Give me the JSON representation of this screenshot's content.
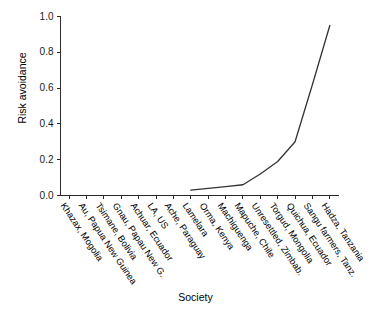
{
  "chart_data": {
    "type": "line",
    "title": "",
    "xlabel": "Society",
    "ylabel": "Risk avoidance",
    "categories": [
      "Khazax, Mogolia",
      "Au, Papua New Guinea",
      "Tsimane, Bolivia",
      "Gnau, Papau New G.",
      "Achuar, Ecuador",
      "LA, US",
      "Ache, Paraguay",
      "Lamelara",
      "Orma, Kenya",
      "Machiguenga",
      "Mapuche, Chile",
      "Unresettled, Zimbab.",
      "Torgud, Mongolia",
      "Quichua, Ecuador",
      "Sangu farmers, Tanz.",
      "Hadza, Tanzania"
    ],
    "values": [
      null,
      null,
      null,
      null,
      null,
      null,
      null,
      0.03,
      0.04,
      0.05,
      0.06,
      0.12,
      0.19,
      0.3,
      0.62,
      0.95
    ],
    "ylim": [
      0.0,
      1.0
    ],
    "ytick_labels": [
      "0.0",
      "0.2",
      "0.4",
      "0.6",
      "0.8",
      "1.0"
    ],
    "ytick_values": [
      0.0,
      0.2,
      0.4,
      0.6,
      0.8,
      1.0
    ],
    "grid": false,
    "legend": null,
    "line_color": "#333333"
  }
}
